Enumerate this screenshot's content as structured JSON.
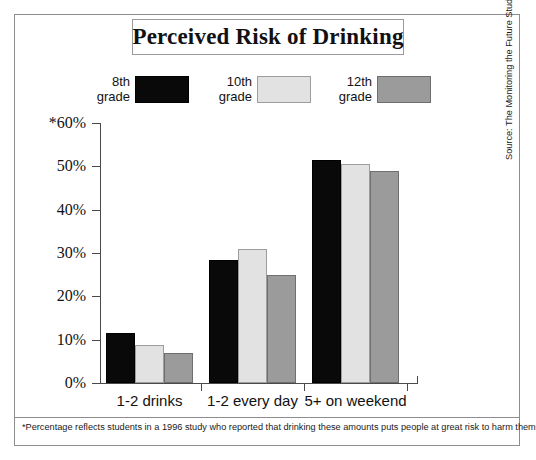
{
  "chart_data": {
    "type": "bar",
    "title": "Perceived Risk of Drinking",
    "xlabel": "",
    "ylabel": "",
    "ylim": [
      0,
      60
    ],
    "ytick_labels": [
      "*60%",
      "50%",
      "40%",
      "30%",
      "20%",
      "10%",
      "0%"
    ],
    "ytick_values": [
      60,
      50,
      40,
      30,
      20,
      10,
      0
    ],
    "grid": false,
    "legend_position": "top",
    "categories": [
      "1-2 drinks",
      "1-2 every day",
      "5+ on weekend"
    ],
    "series": [
      {
        "name": "8th\ngrade",
        "color": "#090909",
        "values": [
          11.5,
          28.5,
          51.5
        ]
      },
      {
        "name": "10th\ngrade",
        "color": "#e2e2e2",
        "values": [
          8.7,
          31.0,
          50.5
        ]
      },
      {
        "name": "12th\ngrade",
        "color": "#9b9b9b",
        "values": [
          7.0,
          25.0,
          49.0
        ]
      }
    ],
    "footnote": "*Percentage reflects students in a 1996 study who reported that drinking these amounts puts people at great risk to harm themselves.",
    "source": "Source: The Monitoring the Future Study, the University of Michigan"
  },
  "colors": {
    "grade8": "#090909",
    "grade10": "#e2e2e2",
    "grade12": "#9b9b9b",
    "axis": "#4a4a4a",
    "frame": "#8d8d8d",
    "text": "#111111"
  }
}
